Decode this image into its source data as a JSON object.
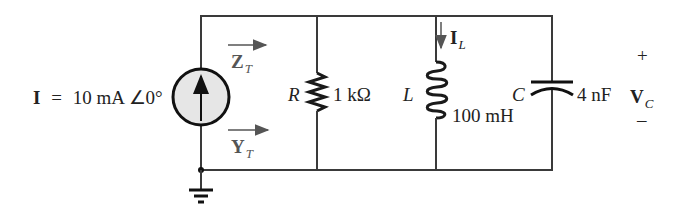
{
  "source": {
    "symbol": "I",
    "equals": "=",
    "value": "10 mA ∠0°",
    "arrow_direction": "up"
  },
  "impedance_label": {
    "symbol": "Z",
    "subscript": "T"
  },
  "admittance_label": {
    "symbol": "Y",
    "subscript": "T"
  },
  "resistor": {
    "name": "R",
    "value": "1 kΩ"
  },
  "inductor": {
    "name": "L",
    "value": "100 mH",
    "current": {
      "symbol": "I",
      "subscript": "L"
    }
  },
  "capacitor": {
    "name": "C",
    "value": "4 nF"
  },
  "capacitor_voltage": {
    "plus": "+",
    "symbol": "V",
    "subscript": "C",
    "minus": "–"
  },
  "colors": {
    "wire": "#3a3a3a",
    "source_fill": "#e6e6e6",
    "text": "#222222",
    "arrow": "#555555"
  }
}
